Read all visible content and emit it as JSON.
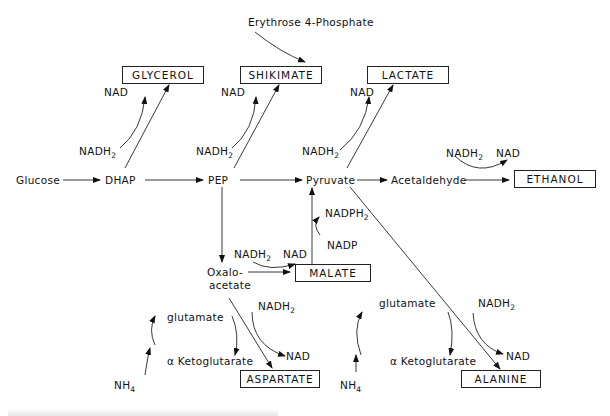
{
  "diagram": {
    "nodes": {
      "glucose": "Glucose",
      "dhap": "DHAP",
      "pep": "PEP",
      "pyruvate": "Pyruvate",
      "acetaldehyde": "Acetaldehyde",
      "oxaloacetate_1": "Oxalo-",
      "oxaloacetate_2": "acetate",
      "erythrose": "Erythrose 4-Phosphate"
    },
    "products": {
      "glycerol": "GLYCEROL",
      "shikimate": "SHIKIMATE",
      "lactate": "LACTATE",
      "ethanol": "ETHANOL",
      "malate": "MALATE",
      "aspartate": "ASPARTATE",
      "alanine": "ALANINE"
    },
    "cofactors": {
      "nad": "NAD",
      "nadh": "NADH",
      "nadph": "NADPH",
      "nadp": "NADP",
      "sub2": "2",
      "nh": "NH",
      "sub4": "4",
      "glutamate": "glutamate",
      "ketoglutarate": "α Ketoglutarate"
    },
    "caption": ""
  }
}
